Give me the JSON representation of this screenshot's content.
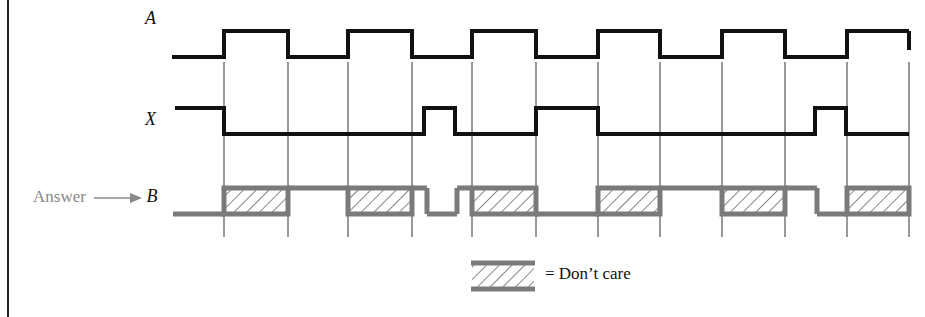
{
  "diagram": {
    "type": "timing-diagram",
    "signals": [
      {
        "name": "A",
        "label": "A"
      },
      {
        "name": "X",
        "label": "X"
      },
      {
        "name": "B",
        "label": "B"
      }
    ],
    "answer_label": "Answer",
    "legend": {
      "symbol": "hatched-box",
      "text": "= Don’t care"
    },
    "colors": {
      "input_wave": "#111111",
      "answer_wave": "#7a7a7a",
      "gridline": "#333333",
      "answer_text": "#888888"
    },
    "gridlines_x": [
      224,
      288,
      348,
      412,
      472,
      536,
      598,
      660,
      722,
      785,
      847,
      909
    ],
    "waveforms": {
      "A": [
        {
          "from": 172,
          "to": 224,
          "level": "0"
        },
        {
          "from": 224,
          "to": 288,
          "level": "1"
        },
        {
          "from": 288,
          "to": 348,
          "level": "0"
        },
        {
          "from": 348,
          "to": 412,
          "level": "1"
        },
        {
          "from": 412,
          "to": 472,
          "level": "0"
        },
        {
          "from": 472,
          "to": 536,
          "level": "1"
        },
        {
          "from": 536,
          "to": 598,
          "level": "0"
        },
        {
          "from": 598,
          "to": 660,
          "level": "1"
        },
        {
          "from": 660,
          "to": 722,
          "level": "0"
        },
        {
          "from": 722,
          "to": 785,
          "level": "1"
        },
        {
          "from": 785,
          "to": 847,
          "level": "0"
        },
        {
          "from": 847,
          "to": 909,
          "level": "1"
        }
      ],
      "X": [
        {
          "from": 175,
          "to": 224,
          "level": "1"
        },
        {
          "from": 224,
          "to": 424,
          "level": "0"
        },
        {
          "from": 424,
          "to": 455,
          "level": "1"
        },
        {
          "from": 455,
          "to": 536,
          "level": "0"
        },
        {
          "from": 536,
          "to": 598,
          "level": "1"
        },
        {
          "from": 598,
          "to": 815,
          "level": "0"
        },
        {
          "from": 815,
          "to": 846,
          "level": "1"
        },
        {
          "from": 846,
          "to": 909,
          "level": "0"
        }
      ],
      "B": [
        {
          "from": 173,
          "to": 224,
          "level": "0"
        },
        {
          "from": 224,
          "to": 288,
          "level": "X"
        },
        {
          "from": 288,
          "to": 348,
          "level": "1"
        },
        {
          "from": 348,
          "to": 412,
          "level": "X"
        },
        {
          "from": 412,
          "to": 427,
          "level": "1"
        },
        {
          "from": 427,
          "to": 457,
          "level": "0"
        },
        {
          "from": 457,
          "to": 472,
          "level": "1"
        },
        {
          "from": 472,
          "to": 536,
          "level": "X"
        },
        {
          "from": 536,
          "to": 598,
          "level": "0"
        },
        {
          "from": 598,
          "to": 660,
          "level": "X"
        },
        {
          "from": 660,
          "to": 722,
          "level": "1"
        },
        {
          "from": 722,
          "to": 785,
          "level": "X"
        },
        {
          "from": 785,
          "to": 817,
          "level": "1"
        },
        {
          "from": 817,
          "to": 847,
          "level": "0"
        },
        {
          "from": 847,
          "to": 909,
          "level": "X"
        }
      ]
    }
  }
}
